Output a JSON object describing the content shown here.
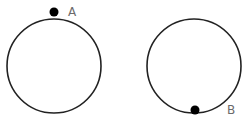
{
  "diagram": {
    "circles": [
      {
        "id": "left",
        "cx": 54,
        "cy": 66,
        "r": 47,
        "stroke": "#222222",
        "point": {
          "label": "A",
          "cx": 54,
          "cy": 12,
          "position": "top"
        }
      },
      {
        "id": "right",
        "cx": 194,
        "cy": 66,
        "r": 47,
        "stroke": "#222222",
        "point": {
          "label": "B",
          "cx": 195,
          "cy": 110,
          "position": "bottom"
        }
      }
    ]
  },
  "labels": {
    "a": "A",
    "b": "B"
  }
}
